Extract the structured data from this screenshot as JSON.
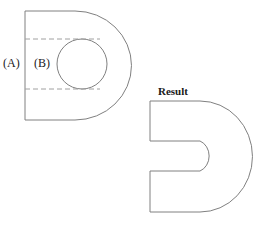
{
  "figure": {
    "title": "",
    "labels": {
      "a": "(A)",
      "b": "(B)",
      "result": "Result"
    },
    "colors": {
      "stroke": "#808080",
      "dashed_stroke": "#a0a0a0",
      "text": "#1a1a1a",
      "background": "#ffffff"
    },
    "stroke_width": 1,
    "dash_pattern": "5 3",
    "left_shape": {
      "name": "d-shape-with-circular-hole",
      "description": "D shaped outline with a circular hole inside",
      "outline_path": "M 25 11 L 75 11 A 56 54 0 0 1 75 120 L 25 120 Z",
      "left_edge_x": 25,
      "top_y": 11,
      "bottom_y": 120,
      "straight_edge_end_x": 75,
      "arc_rx": 56,
      "arc_ry": 54,
      "rightmost_x": 122,
      "circle": {
        "cx": 82,
        "cy": 64,
        "r": 25
      },
      "dashed_lines": [
        {
          "x1": 25,
          "y1": 39,
          "x2": 100,
          "y2": 39
        },
        {
          "x1": 25,
          "y1": 89,
          "x2": 100,
          "y2": 89
        }
      ]
    },
    "right_shape": {
      "name": "horseshoe-result-shape",
      "description": "Same D shape with the circular hole opened into a U shaped slot cut from the left edge",
      "outer_path": "M 150 101 L 200 101 A 52 55 0 0 1 200 212 L 150 212 L 150 171 L 200 171 A 14 16 0 0 0 200 141 L 150 141 Z",
      "left_edge_x": 150,
      "top_y": 101,
      "bottom_y": 212,
      "straight_edge_end_x": 200,
      "rightmost_x": 252,
      "slot_top_y": 141,
      "slot_bottom_y": 171,
      "slot_inner_right_x": 233
    }
  }
}
